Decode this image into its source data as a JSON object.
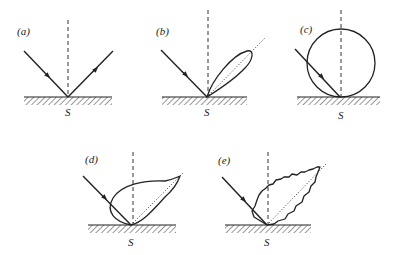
{
  "figure": {
    "panels": [
      {
        "id": "a",
        "label": "(a)",
        "surface_label": "S",
        "description": "specular reflection"
      },
      {
        "id": "b",
        "label": "(b)",
        "surface_label": "S",
        "description": "narrow reflection lobe about specular direction"
      },
      {
        "id": "c",
        "label": "(c)",
        "surface_label": "S",
        "description": "diffuse (Lambertian) circular lobe"
      },
      {
        "id": "d",
        "label": "(d)",
        "surface_label": "S",
        "description": "diffuse plus specular lobe"
      },
      {
        "id": "e",
        "label": "(e)",
        "surface_label": "S",
        "description": "irregular (rough) mixed reflection lobe"
      }
    ],
    "colors": {
      "line": "#222222",
      "background": "#ffffff"
    }
  }
}
